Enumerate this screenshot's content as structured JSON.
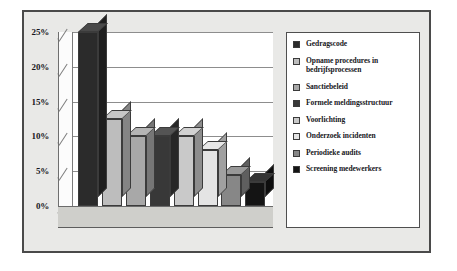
{
  "chart_data": {
    "type": "bar",
    "title": "",
    "subtitle": "",
    "xlabel": "",
    "ylabel": "",
    "ylim": [
      0,
      25
    ],
    "grid": true,
    "legend_position": "right",
    "style": "3d-column",
    "ytick_labels": [
      "25%",
      "20%",
      "15%",
      "10%",
      "5%",
      "0%"
    ],
    "ytick_values": [
      25,
      20,
      15,
      10,
      5,
      0
    ],
    "categories": [
      "Gedragscode",
      "Opname procedures in bedrijfsprocessen",
      "Sanctiebeleid",
      "Formele meldingsstructuur",
      "Voorlichting",
      "Onderzoek incidenten",
      "Periodieke audits",
      "Screening medewerkers"
    ],
    "values": [
      25,
      12.5,
      10,
      10,
      10,
      8,
      4.5,
      3.5
    ],
    "colors": [
      "#2b2b2b",
      "#bdbdbd",
      "#a8a8a8",
      "#383838",
      "#c9c9c9",
      "#e4e4e4",
      "#878787",
      "#141414"
    ]
  },
  "legend": {
    "items": [
      {
        "label": "Gedragscode",
        "color": "#2b2b2b"
      },
      {
        "label": "Opname procedures in bedrijfsprocessen",
        "color": "#bdbdbd"
      },
      {
        "label": "Sanctiebeleid",
        "color": "#a8a8a8"
      },
      {
        "label": "Formele meldingsstructuur",
        "color": "#383838"
      },
      {
        "label": "Voorlichting",
        "color": "#c9c9c9"
      },
      {
        "label": "Onderzoek incidenten",
        "color": "#e4e4e4"
      },
      {
        "label": "Periodieke audits",
        "color": "#878787"
      },
      {
        "label": "Screening medewerkers",
        "color": "#141414"
      }
    ]
  },
  "axis": {
    "ticks": [
      {
        "label": "25%",
        "value": 25
      },
      {
        "label": "20%",
        "value": 20
      },
      {
        "label": "15%",
        "value": 15
      },
      {
        "label": "10%",
        "value": 10
      },
      {
        "label": "5%",
        "value": 5
      },
      {
        "label": "0%",
        "value": 0
      }
    ]
  }
}
